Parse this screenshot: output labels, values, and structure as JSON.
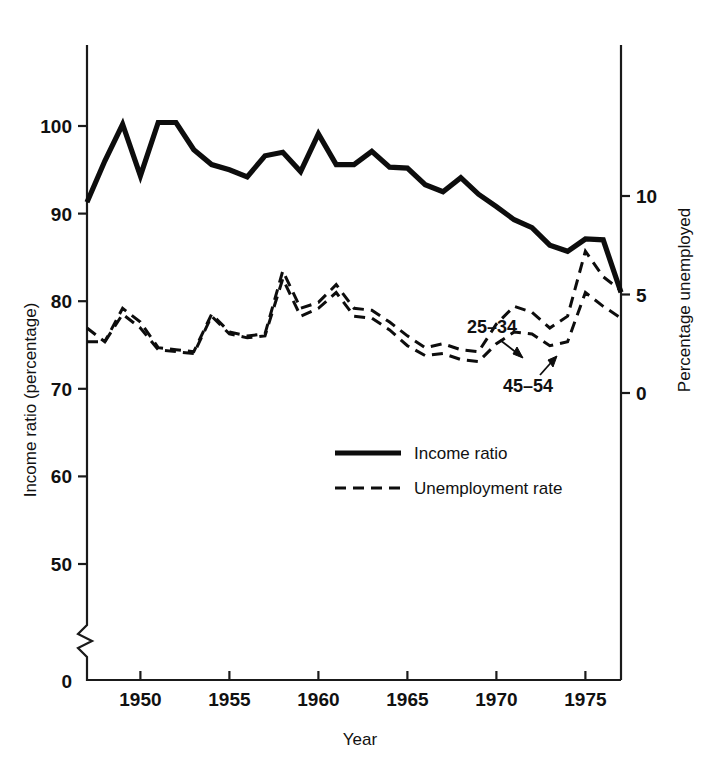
{
  "chart_data": {
    "type": "line",
    "title": "",
    "xlabel": "Year",
    "ylabel": "Income ratio (percentage)",
    "y2label": "Percentage unemployed",
    "xlim": [
      1947,
      1977
    ],
    "ylim": [
      50,
      103
    ],
    "y2lim": [
      -2.5,
      13.5
    ],
    "grid": false,
    "legend_position": "center",
    "x_ticks": [
      1950,
      1955,
      1960,
      1965,
      1970,
      1975
    ],
    "x_tick_labels": [
      "1950",
      "1955",
      "1960",
      "1965",
      "1970",
      "1975"
    ],
    "y_ticks": [
      50,
      60,
      70,
      80,
      90,
      100
    ],
    "y_tick_labels": [
      "50",
      "60",
      "70",
      "80",
      "90",
      "100"
    ],
    "y_axis_break": true,
    "y_origin_label": "0",
    "y2_ticks": [
      0,
      5,
      10
    ],
    "y2_tick_labels": [
      "0",
      "5",
      "10"
    ],
    "legend": [
      {
        "label": "Income ratio",
        "style": "solid"
      },
      {
        "label": "Unemployment rate",
        "style": "dashed"
      }
    ],
    "annotations": [
      {
        "text": "25–34",
        "x": 1968.0,
        "y_axis": "right",
        "points_to": 1970.2
      },
      {
        "text": "45–54",
        "x": 1969.6,
        "y_axis": "right",
        "points_to": 1971.6
      }
    ],
    "series": [
      {
        "name": "Income ratio",
        "style": "solid",
        "axis": "left",
        "x": [
          1947,
          1948,
          1949,
          1950,
          1951,
          1952,
          1953,
          1954,
          1955,
          1956,
          1957,
          1958,
          1959,
          1960,
          1961,
          1962,
          1963,
          1964,
          1965,
          1966,
          1967,
          1968,
          1969,
          1970,
          1971,
          1972,
          1973,
          1974,
          1975,
          1976,
          1977
        ],
        "values": [
          91.3,
          96.0,
          100.2,
          94.3,
          100.4,
          100.4,
          97.3,
          95.6,
          95.0,
          94.2,
          96.6,
          97.0,
          94.8,
          99.1,
          95.6,
          95.6,
          97.1,
          95.3,
          95.2,
          93.3,
          92.5,
          94.1,
          92.2,
          90.8,
          89.3,
          88.4,
          86.4,
          85.7,
          87.1,
          87.0,
          81.0
        ]
      },
      {
        "name": "Unemployment rate 25–34",
        "style": "dashed",
        "axis": "right",
        "x": [
          1947,
          1948,
          1949,
          1950,
          1951,
          1952,
          1953,
          1954,
          1955,
          1956,
          1957,
          1958,
          1959,
          1960,
          1961,
          1962,
          1963,
          1964,
          1965,
          1966,
          1967,
          1968,
          1969,
          1970,
          1971,
          1972,
          1973,
          1974,
          1975,
          1976,
          1977
        ],
        "values": [
          3.3,
          2.6,
          4.3,
          3.6,
          2.3,
          2.2,
          2.1,
          4.0,
          3.1,
          2.9,
          3.0,
          6.2,
          4.3,
          4.6,
          5.5,
          4.3,
          4.2,
          3.6,
          2.9,
          2.3,
          2.5,
          2.2,
          2.1,
          3.5,
          4.4,
          4.1,
          3.3,
          3.9,
          7.2,
          5.9,
          5.2
        ]
      },
      {
        "name": "Unemployment rate 45–54",
        "style": "dashed",
        "axis": "right",
        "x": [
          1947,
          1948,
          1949,
          1950,
          1951,
          1952,
          1953,
          1954,
          1955,
          1956,
          1957,
          1958,
          1959,
          1960,
          1961,
          1962,
          1963,
          1964,
          1965,
          1966,
          1967,
          1968,
          1969,
          1970,
          1971,
          1972,
          1973,
          1974,
          1975,
          1976,
          1977
        ],
        "values": [
          2.6,
          2.6,
          4.0,
          3.3,
          2.2,
          2.1,
          2.0,
          3.9,
          3.0,
          2.8,
          2.9,
          5.8,
          3.9,
          4.3,
          5.1,
          3.9,
          3.8,
          3.2,
          2.4,
          1.9,
          2.0,
          1.7,
          1.6,
          2.5,
          3.1,
          3.0,
          2.4,
          2.6,
          5.1,
          4.4,
          3.8
        ]
      }
    ]
  }
}
